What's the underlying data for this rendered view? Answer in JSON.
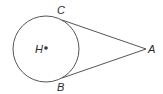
{
  "diagram": {
    "type": "geometry",
    "circle": {
      "center_label": "H",
      "cx": 46,
      "cy": 49,
      "r": 33
    },
    "points": {
      "H": {
        "label": "H",
        "x": 46,
        "y": 49
      },
      "A": {
        "label": "A",
        "x": 146,
        "y": 49
      },
      "C": {
        "label": "C",
        "x": 62,
        "y": 20
      },
      "B": {
        "label": "B",
        "x": 62,
        "y": 78
      }
    },
    "segments": [
      {
        "from": "C",
        "to": "A"
      },
      {
        "from": "B",
        "to": "A"
      }
    ],
    "stroke_color": "#555555"
  }
}
